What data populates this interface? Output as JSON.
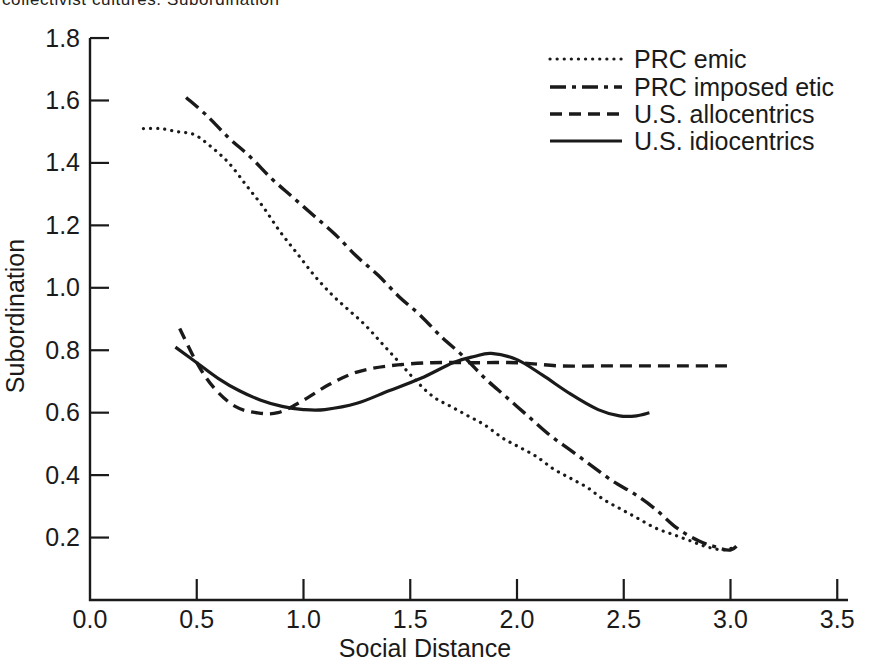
{
  "page": {
    "caption_clipped": "collectivist cultures: Subordination",
    "background": "#ffffff",
    "ink_color": "#1a1a1a"
  },
  "chart_data": {
    "type": "line",
    "title": "",
    "xlabel": "Social Distance",
    "ylabel": "Subordination",
    "xlim": [
      0,
      3.5
    ],
    "ylim": [
      0,
      1.8
    ],
    "grid": false,
    "legend_position": "top-right",
    "x_ticks": [
      0.0,
      0.5,
      1.0,
      1.5,
      2.0,
      2.5,
      3.0,
      3.5
    ],
    "x_tick_labels": [
      "0.0",
      "0.5",
      "1.0",
      "1.5",
      "2.0",
      "2.5",
      "3.0",
      "3.5"
    ],
    "y_ticks": [
      0.2,
      0.4,
      0.6,
      0.8,
      1.0,
      1.2,
      1.4,
      1.6,
      1.8
    ],
    "y_tick_labels": [
      "0.2",
      "0.4",
      "0.6",
      "0.8",
      "1.0",
      "1.2",
      "1.4",
      "1.6",
      "1.8"
    ],
    "series": [
      {
        "name": "PRC emic",
        "style": "dotted",
        "points": [
          [
            0.25,
            1.51
          ],
          [
            0.33,
            1.51
          ],
          [
            0.41,
            1.5
          ],
          [
            0.49,
            1.49
          ],
          [
            0.57,
            1.45
          ],
          [
            0.65,
            1.4
          ],
          [
            0.73,
            1.33
          ],
          [
            0.81,
            1.26
          ],
          [
            0.89,
            1.18
          ],
          [
            0.97,
            1.11
          ],
          [
            1.05,
            1.04
          ],
          [
            1.13,
            0.98
          ],
          [
            1.21,
            0.93
          ],
          [
            1.29,
            0.88
          ],
          [
            1.37,
            0.82
          ],
          [
            1.45,
            0.76
          ],
          [
            1.53,
            0.7
          ],
          [
            1.61,
            0.65
          ],
          [
            1.69,
            0.62
          ],
          [
            1.77,
            0.59
          ],
          [
            1.85,
            0.56
          ],
          [
            1.93,
            0.52
          ],
          [
            2.01,
            0.49
          ],
          [
            2.09,
            0.46
          ],
          [
            2.17,
            0.42
          ],
          [
            2.25,
            0.39
          ],
          [
            2.33,
            0.36
          ],
          [
            2.41,
            0.32
          ],
          [
            2.49,
            0.29
          ],
          [
            2.57,
            0.26
          ],
          [
            2.65,
            0.23
          ],
          [
            2.73,
            0.21
          ],
          [
            2.81,
            0.19
          ],
          [
            2.89,
            0.17
          ],
          [
            2.97,
            0.16
          ],
          [
            3.02,
            0.17
          ]
        ]
      },
      {
        "name": "PRC imposed etic",
        "style": "dashdot",
        "points": [
          [
            0.45,
            1.61
          ],
          [
            0.55,
            1.55
          ],
          [
            0.65,
            1.48
          ],
          [
            0.75,
            1.42
          ],
          [
            0.85,
            1.35
          ],
          [
            0.95,
            1.29
          ],
          [
            1.05,
            1.23
          ],
          [
            1.15,
            1.17
          ],
          [
            1.25,
            1.1
          ],
          [
            1.35,
            1.04
          ],
          [
            1.45,
            0.97
          ],
          [
            1.55,
            0.91
          ],
          [
            1.65,
            0.84
          ],
          [
            1.75,
            0.78
          ],
          [
            1.85,
            0.71
          ],
          [
            1.95,
            0.65
          ],
          [
            2.05,
            0.59
          ],
          [
            2.15,
            0.53
          ],
          [
            2.25,
            0.48
          ],
          [
            2.35,
            0.43
          ],
          [
            2.45,
            0.38
          ],
          [
            2.55,
            0.34
          ],
          [
            2.65,
            0.29
          ],
          [
            2.75,
            0.23
          ],
          [
            2.85,
            0.19
          ],
          [
            2.93,
            0.17
          ],
          [
            3.0,
            0.16
          ],
          [
            3.04,
            0.18
          ]
        ]
      },
      {
        "name": "U.S. allocentrics",
        "style": "dashed",
        "points": [
          [
            0.42,
            0.87
          ],
          [
            0.5,
            0.76
          ],
          [
            0.58,
            0.68
          ],
          [
            0.68,
            0.62
          ],
          [
            0.78,
            0.6
          ],
          [
            0.88,
            0.6
          ],
          [
            1.0,
            0.64
          ],
          [
            1.12,
            0.69
          ],
          [
            1.25,
            0.73
          ],
          [
            1.4,
            0.75
          ],
          [
            1.6,
            0.76
          ],
          [
            1.8,
            0.76
          ],
          [
            2.0,
            0.76
          ],
          [
            2.2,
            0.75
          ],
          [
            2.4,
            0.75
          ],
          [
            2.6,
            0.75
          ],
          [
            2.8,
            0.75
          ],
          [
            3.0,
            0.75
          ]
        ]
      },
      {
        "name": "U.S. idiocentrics",
        "style": "solid",
        "points": [
          [
            0.4,
            0.81
          ],
          [
            0.5,
            0.76
          ],
          [
            0.6,
            0.71
          ],
          [
            0.7,
            0.67
          ],
          [
            0.8,
            0.64
          ],
          [
            0.9,
            0.62
          ],
          [
            1.0,
            0.61
          ],
          [
            1.1,
            0.61
          ],
          [
            1.25,
            0.63
          ],
          [
            1.4,
            0.67
          ],
          [
            1.55,
            0.71
          ],
          [
            1.7,
            0.76
          ],
          [
            1.8,
            0.78
          ],
          [
            1.88,
            0.79
          ],
          [
            2.0,
            0.77
          ],
          [
            2.12,
            0.72
          ],
          [
            2.25,
            0.66
          ],
          [
            2.38,
            0.61
          ],
          [
            2.48,
            0.59
          ],
          [
            2.56,
            0.59
          ],
          [
            2.62,
            0.6
          ]
        ]
      }
    ]
  }
}
